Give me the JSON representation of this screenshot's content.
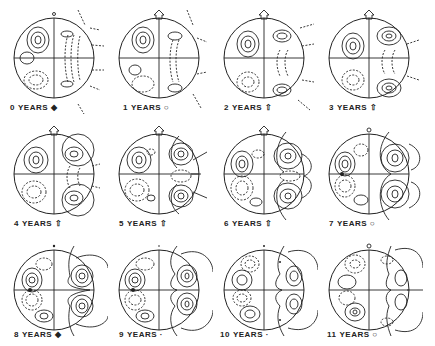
{
  "figure": {
    "unit_label": "YEARS",
    "panels": [
      {
        "year": "0",
        "label": "0 YEARS",
        "pole_marker": "dot",
        "pole_marker_bottom": "dot"
      },
      {
        "year": "1",
        "label": "1 YEARS",
        "pole_marker": "small-arrow",
        "pole_marker_bottom": "small-circle"
      },
      {
        "year": "2",
        "label": "2 YEARS",
        "pole_marker": "arrow-up",
        "pole_marker_bottom": "arrow-up"
      },
      {
        "year": "3",
        "label": "3 YEARS",
        "pole_marker": "arrow-up",
        "pole_marker_bottom": "arrow-up"
      },
      {
        "year": "4",
        "label": "4 YEARS",
        "pole_marker": "arrow-up",
        "pole_marker_bottom": "arrow-up"
      },
      {
        "year": "5",
        "label": "5 YEARS",
        "pole_marker": "arrow-up",
        "pole_marker_bottom": "arrow-up"
      },
      {
        "year": "6",
        "label": "6 YEARS",
        "pole_marker": "arrow-up",
        "pole_marker_bottom": "arrow-up"
      },
      {
        "year": "7",
        "label": "7 YEARS",
        "pole_marker": "small-circle",
        "pole_marker_bottom": "small-circle"
      },
      {
        "year": "8",
        "label": "8 YEARS",
        "pole_marker": "dot",
        "pole_marker_bottom": "dot"
      },
      {
        "year": "9",
        "label": "9 YEARS",
        "pole_marker": "dot",
        "pole_marker_bottom": "dot"
      },
      {
        "year": "10",
        "label": "10 YEARS",
        "pole_marker": "dot",
        "pole_marker_bottom": "dot"
      },
      {
        "year": "11",
        "label": "11 YEARS",
        "pole_marker": "small-circle",
        "pole_marker_bottom": "small-circle"
      }
    ],
    "labels": {
      "p0": {
        "num": "0",
        "word": "YEARS"
      },
      "p1": {
        "num": "1",
        "word": "YEARS"
      },
      "p2": {
        "num": "2",
        "word": "YEARS"
      },
      "p3": {
        "num": "3",
        "word": "YEARS"
      },
      "p4": {
        "num": "4",
        "word": "YEARS"
      },
      "p5": {
        "num": "5",
        "word": "YEARS"
      },
      "p6": {
        "num": "6",
        "word": "YEARS"
      },
      "p7": {
        "num": "7",
        "word": "YEARS"
      },
      "p8": {
        "num": "8",
        "word": "YEARS"
      },
      "p9": {
        "num": "9",
        "word": "YEARS"
      },
      "p10": {
        "num": "10",
        "word": "YEARS"
      },
      "p11": {
        "num": "11",
        "word": "YEARS"
      }
    },
    "colors": {
      "ink": "#222222",
      "background": "#ffffff"
    }
  }
}
